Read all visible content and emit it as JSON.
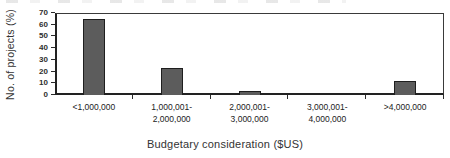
{
  "chart_data": {
    "type": "bar",
    "title": "",
    "categories": [
      "<1,000,000",
      "1,000,001-\n2,000,000",
      "2,000,001-\n3,000,000",
      "3,000,001-\n4,000,000",
      ">4,000,000"
    ],
    "values": [
      65,
      23,
      3,
      0,
      12
    ],
    "xlabel": "Budgetary consideration ($US)",
    "ylabel": "No. of projects (%)",
    "ylim": [
      0,
      70
    ],
    "yticks": [
      0,
      10,
      20,
      30,
      40,
      50,
      60,
      70
    ],
    "grid": false,
    "legend": "none",
    "bar_color": "#5c5c5c",
    "bar_border_color": "#1e1e1e",
    "axis_color": "#2b2b2b"
  }
}
